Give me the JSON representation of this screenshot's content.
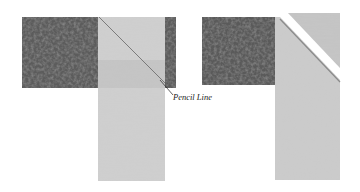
{
  "figure": {
    "panels": [
      {
        "id": "left",
        "description": "Light strip laid perpendicular over dark strip with diagonal pencil line drawn",
        "annotation": "Pencil Line"
      },
      {
        "id": "right",
        "description": "Strips sewn on diagonal and excess corner trimmed away"
      }
    ],
    "colors": {
      "dark_fabric": "#5a5a5a",
      "dark_fabric_mottle": "#3f3f3f",
      "light_fabric": "#c9c9c9",
      "light_fabric_mottle": "#b5b5b5",
      "pencil_line": "#555555",
      "background": "#ffffff"
    }
  }
}
